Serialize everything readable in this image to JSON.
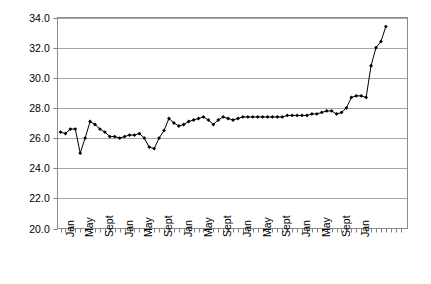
{
  "chart_data": {
    "type": "line",
    "title": "",
    "subtitle": "",
    "xlabel": "",
    "ylabel": "",
    "grid": true,
    "legend": null,
    "marker": "filled-diamond",
    "line_color": "#000000",
    "grid_color": "#a6a6a6",
    "axis_color": "#808080",
    "ylim": [
      20.0,
      34.0
    ],
    "ytick_step": 2.0,
    "ytick_labels": [
      "34.0",
      "32.0",
      "30.0",
      "28.0",
      "26.0",
      "24.0",
      "22.0",
      "20.0"
    ],
    "ytick_values": [
      34.0,
      32.0,
      30.0,
      28.0,
      26.0,
      24.0,
      22.0,
      20.0
    ],
    "xtick_labels_visible": [
      "Jan",
      "May",
      "Sept",
      "Jan",
      "May",
      "Sept",
      "Jan",
      "May",
      "Sept",
      "Jan",
      "May",
      "Sept",
      "Jan",
      "May",
      "Sept",
      "Jan"
    ],
    "xtick_label_rotation": -90,
    "x_categories": [
      "Jan",
      "Feb",
      "Mar",
      "Apr",
      "May",
      "Jun",
      "Jul",
      "Aug",
      "Sept",
      "Oct",
      "Nov",
      "Dec",
      "Jan",
      "Feb",
      "Mar",
      "Apr",
      "May",
      "Jun",
      "Jul",
      "Aug",
      "Sept",
      "Oct",
      "Nov",
      "Dec",
      "Jan",
      "Feb",
      "Mar",
      "Apr",
      "May",
      "Jun",
      "Jul",
      "Aug",
      "Sept",
      "Oct",
      "Nov",
      "Dec",
      "Jan",
      "Feb",
      "Mar",
      "Apr",
      "May",
      "Jun",
      "Jul",
      "Aug",
      "Sept",
      "Oct",
      "Nov",
      "Dec",
      "Jan",
      "Feb",
      "Mar",
      "Apr",
      "May",
      "Jun",
      "Jul",
      "Aug",
      "Sept",
      "Oct",
      "Nov",
      "Dec",
      "Jan",
      "Feb",
      "Mar",
      "Apr",
      "May",
      "Jun",
      "Jul",
      "Aug",
      "Sept",
      "Oct",
      "Nov",
      "Dec",
      "Jan"
    ],
    "values": [
      26.4,
      26.3,
      26.6,
      26.6,
      25.0,
      26.0,
      27.1,
      26.9,
      26.6,
      26.4,
      26.1,
      26.1,
      26.0,
      26.1,
      26.2,
      26.2,
      26.3,
      26.0,
      25.4,
      25.3,
      26.0,
      26.5,
      27.3,
      27.0,
      26.8,
      26.9,
      27.1,
      27.2,
      27.3,
      27.4,
      27.2,
      26.9,
      27.2,
      27.4,
      27.3,
      27.2,
      27.3,
      27.4,
      27.4,
      27.4,
      27.4,
      27.4,
      27.4,
      27.4,
      27.4,
      27.4,
      27.5,
      27.5,
      27.5,
      27.5,
      27.5,
      27.6,
      27.6,
      27.7,
      27.8,
      27.8,
      27.6,
      27.7,
      28.0,
      28.7,
      28.8,
      28.8,
      28.7,
      30.8,
      32.0,
      32.4,
      33.4
    ],
    "n_points": 67
  }
}
